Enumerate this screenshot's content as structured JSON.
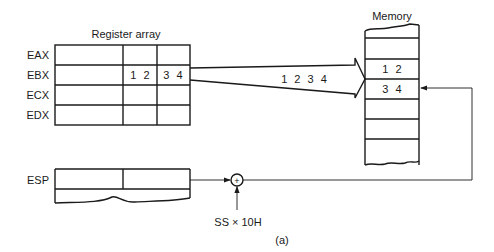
{
  "register_array": {
    "title": "Register array",
    "registers": [
      {
        "name": "EAX",
        "cells": [
          "",
          "",
          ""
        ]
      },
      {
        "name": "EBX",
        "cells": [
          "",
          "1 2",
          "3 4"
        ]
      },
      {
        "name": "ECX",
        "cells": [
          "",
          "",
          ""
        ]
      },
      {
        "name": "EDX",
        "cells": [
          "",
          "",
          ""
        ]
      }
    ]
  },
  "memory": {
    "title": "Memory",
    "cells": [
      "",
      "",
      "1 2",
      "3 4",
      "",
      "",
      ""
    ]
  },
  "transfer_arrow": {
    "label": "1 2 3 4"
  },
  "stack_pointer": {
    "name": "ESP"
  },
  "adder": {
    "symbol": "+",
    "input_label": "SS × 10H"
  },
  "caption": "(a)"
}
